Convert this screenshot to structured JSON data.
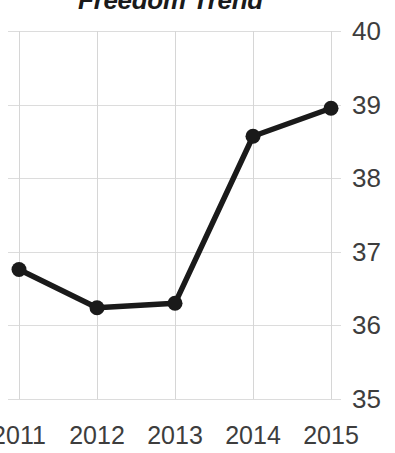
{
  "chart_data": {
    "type": "line",
    "title": "Freedom Trend",
    "xlabel": "",
    "ylabel": "",
    "categories": [
      "2011",
      "2012",
      "2013",
      "2014",
      "2015"
    ],
    "x": [
      2011,
      2012,
      2013,
      2014,
      2015
    ],
    "values": [
      36.76,
      36.24,
      36.3,
      38.57,
      38.95
    ],
    "series": [
      {
        "name": "Freedom Trend",
        "values": [
          36.76,
          36.24,
          36.3,
          38.57,
          38.95
        ],
        "color": "#1a1a1a",
        "marker": "circle"
      }
    ],
    "ylim": [
      35,
      40
    ],
    "xlim": [
      2011,
      2015
    ],
    "yticks": [
      40,
      39,
      38,
      37,
      36,
      35
    ],
    "ytick_labels": [
      "40",
      "39",
      "38",
      "37",
      "36",
      "35"
    ],
    "xticks": [
      2011,
      2012,
      2013,
      2014,
      2015
    ],
    "xtick_labels": [
      "2011",
      "2012",
      "2013",
      "2014",
      "2015"
    ],
    "grid": true,
    "grid_color": "#d9d9d9",
    "legend": false,
    "legend_position": "none",
    "y_axis_side": "right",
    "background_color": "#ffffff",
    "title_color": "#1a1a1a",
    "tick_label_color": "#3d3d3d"
  }
}
